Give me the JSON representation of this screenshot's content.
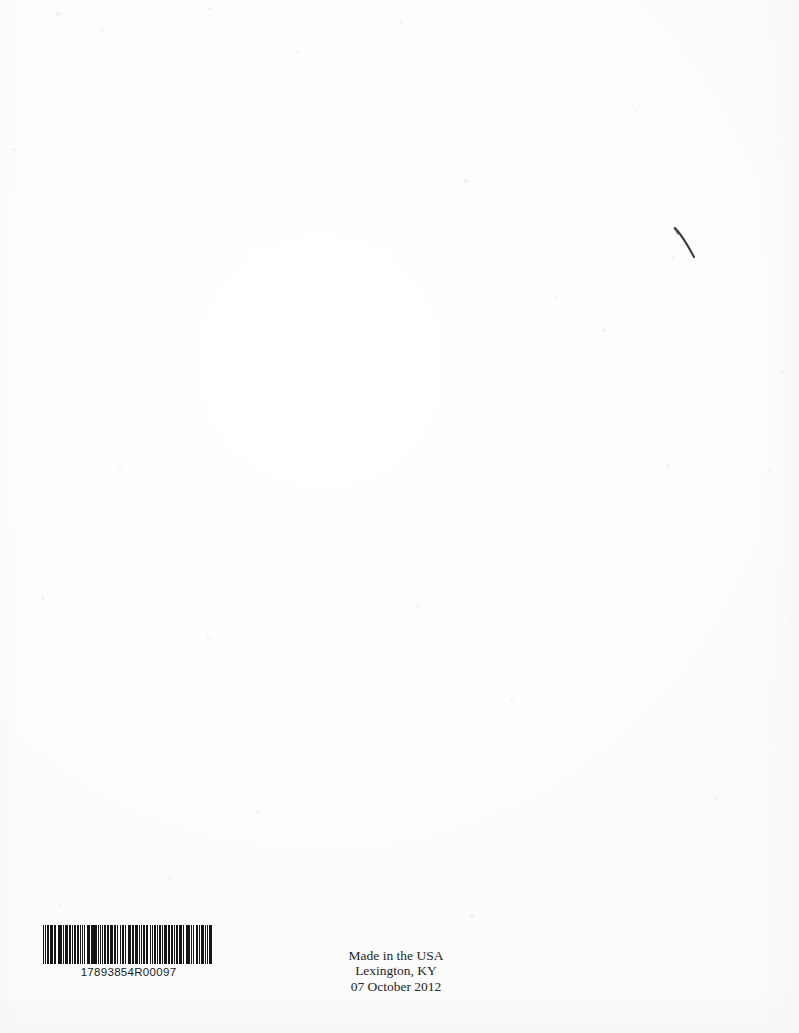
{
  "page": {
    "kind": "scanned-book-back-cover",
    "background_color": "#fefefe",
    "ink_color": "#262626",
    "width_px": 799,
    "height_px": 1033
  },
  "barcode": {
    "name": "code-128-barcode",
    "human_readable_number": "17893854R00097",
    "bar_color": "#151515",
    "quiet_zone_color": "#ffffff",
    "pattern": [
      3,
      1,
      1,
      2,
      4,
      1,
      2,
      1,
      3,
      2,
      1,
      1,
      2,
      3,
      1,
      2,
      1,
      1,
      4,
      1,
      2,
      2,
      1,
      1,
      3,
      1,
      2,
      1,
      1,
      3,
      2,
      1,
      4,
      2,
      1,
      1,
      2,
      1,
      3,
      1,
      1,
      2,
      2,
      4,
      1,
      1,
      3,
      2,
      1,
      1,
      2,
      1,
      4,
      1,
      1,
      2,
      3,
      1,
      2,
      2,
      1,
      3,
      1,
      1,
      2,
      1,
      4,
      2,
      1,
      1,
      3,
      1,
      1,
      2,
      2,
      1,
      3,
      2,
      1,
      4,
      1,
      1,
      2,
      1,
      2,
      3,
      1,
      1,
      4,
      2,
      1,
      1,
      2,
      2,
      3,
      1,
      1,
      2,
      1,
      3,
      2,
      1,
      4,
      1,
      1,
      1,
      2,
      4,
      1,
      2,
      3,
      1,
      1,
      2,
      2,
      1,
      1,
      3,
      4,
      1,
      2,
      1,
      1,
      2,
      3,
      2,
      1,
      1,
      2,
      1,
      4,
      2,
      1,
      3,
      1,
      1,
      2,
      2,
      1,
      1,
      3,
      1,
      2,
      4,
      1,
      1,
      2,
      1,
      3,
      2,
      2,
      1,
      1,
      4,
      1,
      1,
      3,
      1,
      2,
      2,
      1,
      1,
      4,
      1,
      2,
      3,
      1,
      2,
      1,
      1,
      3,
      4
    ]
  },
  "imprint": {
    "name": "made-in-usa-imprint",
    "lines": [
      "Made in the USA",
      "Lexington, KY",
      "07 October 2012"
    ],
    "line1": "Made in the USA",
    "line2": "Lexington, KY",
    "line3": "07 October 2012"
  },
  "annotations": {
    "pen_mark": {
      "name": "pen-stroke-mark",
      "color": "#3a3a3a",
      "description": "thin curved diagonal handwritten stroke"
    }
  }
}
